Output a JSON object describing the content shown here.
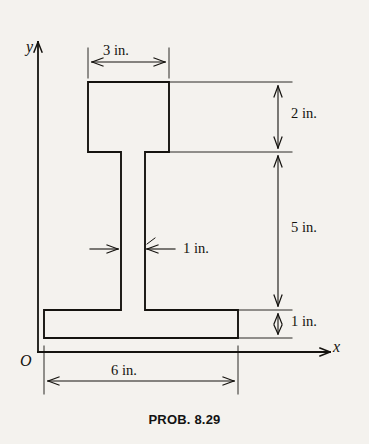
{
  "figure": {
    "caption": "PROB. 8.29",
    "axes": {
      "y_label": "y",
      "x_label": "x",
      "origin_label": "O"
    },
    "dimensions": {
      "top_flange_width": "3 in.",
      "top_flange_depth": "2 in.",
      "web_height": "5 in.",
      "web_thickness": "1 in.",
      "bottom_flange_depth": "1 in.",
      "bottom_flange_width": "6 in."
    },
    "colors": {
      "ink": "#15130f",
      "background": "#f4f2ee"
    }
  }
}
